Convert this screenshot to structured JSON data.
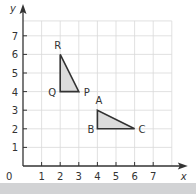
{
  "chart_data": {
    "type": "scatter",
    "title": "",
    "xlabel": "x",
    "ylabel": "y",
    "xlim": [
      0,
      7
    ],
    "ylim": [
      0,
      7
    ],
    "x_ticks": [
      "1",
      "2",
      "3",
      "4",
      "5",
      "6",
      "7"
    ],
    "y_ticks": [
      "1",
      "2",
      "3",
      "4",
      "5",
      "6",
      "7"
    ],
    "origin_label": "0",
    "grid": true,
    "shapes": [
      {
        "name": "triangle PQR",
        "vertices": [
          {
            "label": "R",
            "x": 2,
            "y": 6
          },
          {
            "label": "Q",
            "x": 2,
            "y": 4
          },
          {
            "label": "P",
            "x": 3,
            "y": 4
          }
        ]
      },
      {
        "name": "triangle ABC",
        "vertices": [
          {
            "label": "A",
            "x": 4,
            "y": 3
          },
          {
            "label": "B",
            "x": 4,
            "y": 2
          },
          {
            "label": "C",
            "x": 6,
            "y": 2
          }
        ]
      }
    ],
    "colors": {
      "fill": "#dcdcdc",
      "stroke": "#333333",
      "grid": "#d9d9d9",
      "band": "#d2d3d5"
    }
  }
}
